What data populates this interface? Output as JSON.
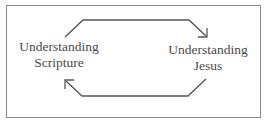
{
  "diagram": {
    "type": "cycle",
    "nodes": [
      {
        "id": "understanding-scripture",
        "lines": [
          "Understanding",
          "Scripture"
        ]
      },
      {
        "id": "understanding-jesus",
        "lines": [
          "Understanding",
          "Jesus"
        ]
      }
    ],
    "edges": [
      {
        "from": "understanding-scripture",
        "to": "understanding-jesus",
        "route": "top"
      },
      {
        "from": "understanding-jesus",
        "to": "understanding-scripture",
        "route": "bottom"
      }
    ],
    "colors": {
      "text": "#4a4a4a",
      "arrow": "#555555",
      "border": "#8a8a8a",
      "background": "#ffffff"
    }
  }
}
